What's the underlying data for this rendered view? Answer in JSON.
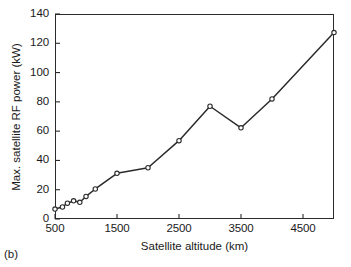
{
  "figure": {
    "panel_caption": "(b)",
    "background_color": "#ffffff",
    "line_color": "#2b2b2b",
    "marker_face_color": "#ffffff",
    "axis_color": "#2b2b2b"
  },
  "chart_data": {
    "type": "line",
    "title": "",
    "xlabel": "Satellite altitude (km)",
    "ylabel": "Max. satellite RF power (kW)",
    "xlim": [
      500,
      5000
    ],
    "ylim": [
      0,
      140
    ],
    "xticks": [
      500,
      1500,
      2500,
      3500,
      4500
    ],
    "xtick_labels": [
      "500",
      "1500",
      "2500",
      "3500",
      "4500"
    ],
    "yticks": [
      0,
      20,
      40,
      60,
      80,
      100,
      120,
      140
    ],
    "ytick_labels": [
      "0",
      "20",
      "40",
      "60",
      "80",
      "100",
      "120",
      "140"
    ],
    "grid": false,
    "legend": null,
    "marker": "circle-open",
    "series": [
      {
        "name": "Max. satellite RF power",
        "x": [
          500,
          620,
          700,
          800,
          900,
          1000,
          1150,
          1500,
          2000,
          2500,
          3000,
          3500,
          4000,
          5000
        ],
        "y": [
          6.8,
          8.2,
          10.8,
          12.4,
          11.4,
          15.4,
          20.5,
          31.2,
          35.0,
          53.5,
          77.0,
          62.3,
          82.0,
          127.3
        ]
      }
    ]
  }
}
